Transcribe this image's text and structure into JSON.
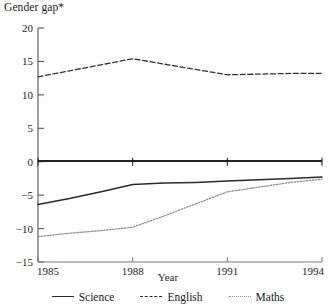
{
  "chart_data": {
    "type": "line",
    "title": "",
    "ylabel": "Gender gap*",
    "xlabel": "Year",
    "x": [
      1985,
      1986,
      1987,
      1988,
      1989,
      1990,
      1991,
      1992,
      1993,
      1994
    ],
    "xticks": [
      "1985",
      "1988",
      "1991",
      "1994"
    ],
    "yticks": [
      "20",
      "15",
      "10",
      "5",
      "0",
      "-5",
      "-10",
      "-15"
    ],
    "ylim": [
      -15,
      20
    ],
    "xlim": [
      1985,
      1994
    ],
    "grid": false,
    "legend_position": "bottom",
    "zero_line": true,
    "series": [
      {
        "name": "Science",
        "style": "solid",
        "color": "#2b2b2b",
        "values": [
          -6.4,
          -5.5,
          -4.5,
          -3.4,
          -3.2,
          -3.1,
          -2.9,
          -2.7,
          -2.5,
          -2.3
        ]
      },
      {
        "name": "English",
        "style": "dashed",
        "color": "#333333",
        "values": [
          12.7,
          13.6,
          14.5,
          15.4,
          14.6,
          13.8,
          13.0,
          13.1,
          13.2,
          13.2
        ]
      },
      {
        "name": "Maths",
        "style": "dotted",
        "color": "#8e8e8e",
        "values": [
          -11.2,
          -10.7,
          -10.3,
          -9.8,
          -8.1,
          -6.3,
          -4.5,
          -3.8,
          -3.1,
          -2.6
        ]
      }
    ]
  },
  "axis": {
    "y_title": "Gender gap*",
    "x_title": "Year"
  },
  "legend": {
    "items": [
      {
        "label": "Science",
        "style": "solid"
      },
      {
        "label": "English",
        "style": "dashed"
      },
      {
        "label": "Maths",
        "style": "dotted"
      }
    ]
  }
}
